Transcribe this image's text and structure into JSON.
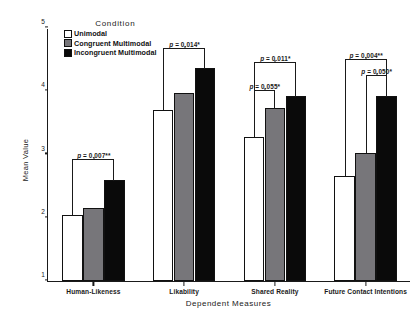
{
  "chart_data": {
    "type": "bar",
    "title": "",
    "xlabel": "Dependent Measures",
    "ylabel": "Mean Value",
    "ylim": [
      1,
      5
    ],
    "yticks": [
      1,
      2,
      3,
      4,
      5
    ],
    "ytick_labels": [
      "1",
      "2",
      "3",
      "4",
      "5"
    ],
    "grid": false,
    "legend_position": "top-left-inside",
    "legend_title": "Condition",
    "categories": [
      "Human-Likeness",
      "Likability",
      "Shared Reality",
      "Future Contact Intentions"
    ],
    "series": [
      {
        "name": "Unimodal",
        "color": "#ffffff",
        "values": [
          2.05,
          3.71,
          3.28,
          2.66
        ]
      },
      {
        "name": "Congruent Multimodal",
        "color": "#77767a",
        "values": [
          2.15,
          3.97,
          3.74,
          3.03
        ]
      },
      {
        "name": "Incongruent Multimodal",
        "color": "#0a0a0a",
        "values": [
          2.6,
          4.37,
          3.93,
          3.92
        ]
      }
    ],
    "annotations": [
      {
        "category": "Human-Likeness",
        "label": "p = 0.007**",
        "from_series": "Unimodal",
        "to_series": "Incongruent Multimodal",
        "bracket_top_value": 2.93
      },
      {
        "category": "Likability",
        "label": "p = 0.014*",
        "from_series": "Unimodal",
        "to_series": "Incongruent Multimodal",
        "bracket_top_value": 4.68
      },
      {
        "category": "Shared Reality",
        "label": "p = 0.011*",
        "from_series": "Unimodal",
        "to_series": "Incongruent Multimodal",
        "bracket_top_value": 4.46
      },
      {
        "category": "Shared Reality",
        "label": "p = 0.055*",
        "from_series": "Unimodal",
        "to_series": "Congruent Multimodal",
        "bracket_top_value": 4.02
      },
      {
        "category": "Future Contact Intentions",
        "label": "p = 0.004**",
        "from_series": "Unimodal",
        "to_series": "Incongruent Multimodal",
        "bracket_top_value": 4.51
      },
      {
        "category": "Future Contact Intentions",
        "label": "p = 0.050*",
        "from_series": "Congruent Multimodal",
        "to_series": "Incongruent Multimodal",
        "bracket_top_value": 4.26
      }
    ]
  },
  "legend": {
    "title": "Condition",
    "items": [
      {
        "label": "Unimodal",
        "swatch": "unimodal"
      },
      {
        "label": "Congruent Multimodal",
        "swatch": "congruent"
      },
      {
        "label": "Incongruent Multimodal",
        "swatch": "incongruent"
      }
    ]
  },
  "axes": {
    "y_title": "Mean Value",
    "x_title": "Dependent Measures",
    "y_tick_labels": [
      "1",
      "2",
      "3",
      "4",
      "5"
    ],
    "x_tick_labels": [
      "Human-Likeness",
      "Likability",
      "Shared Reality",
      "Future Contact Intentions"
    ]
  }
}
